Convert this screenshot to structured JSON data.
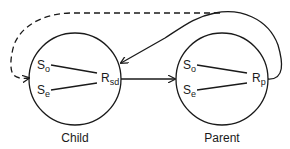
{
  "diagram": {
    "nodes": [
      {
        "id": "child",
        "caption": "Child",
        "symbols": {
          "s_o": {
            "base": "S",
            "sub": "o"
          },
          "s_e": {
            "base": "S",
            "sub": "e"
          },
          "r": {
            "base": "R",
            "sub": "sd"
          }
        }
      },
      {
        "id": "parent",
        "caption": "Parent",
        "symbols": {
          "s_o": {
            "base": "S",
            "sub": "o"
          },
          "s_e": {
            "base": "S",
            "sub": "e"
          },
          "r": {
            "base": "R",
            "sub": "p"
          }
        }
      }
    ],
    "edges": [
      {
        "from": "child.R_sd",
        "to": "parent",
        "style": "solid"
      },
      {
        "from": "parent.R_p",
        "to": "child",
        "style": "solid",
        "route": "loop-over-top"
      },
      {
        "from": "parent.R_p",
        "to": "child.left",
        "style": "dashed",
        "route": "over-top"
      }
    ],
    "colors": {
      "stroke": "#1a1a1a",
      "background": "#ffffff"
    }
  }
}
